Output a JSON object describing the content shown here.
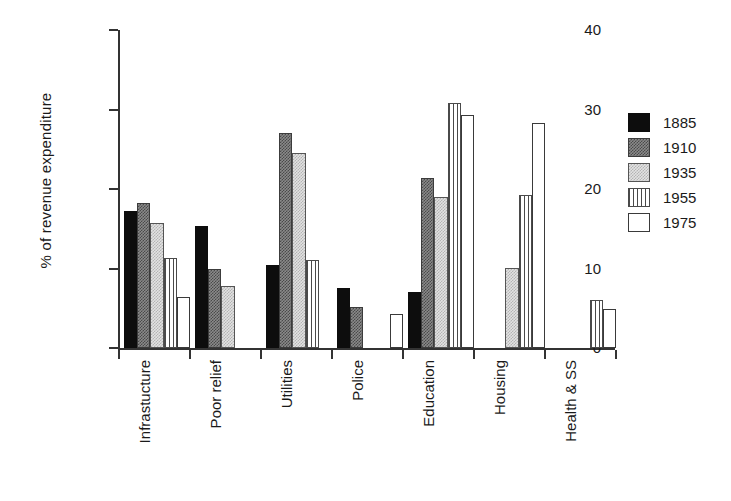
{
  "chart_data": {
    "type": "bar",
    "title": "",
    "subtitle": "",
    "xlabel": "",
    "ylabel": "% of revenue expenditure",
    "ylim": [
      0,
      40
    ],
    "yticks": [
      0,
      10,
      20,
      30,
      40
    ],
    "ytick_labels": [
      "0",
      "10",
      "20",
      "30",
      "40"
    ],
    "grid": false,
    "legend_position": "right",
    "categories": [
      "Infrastucture",
      "Poor relief",
      "Utilities",
      "Police",
      "Education",
      "Housing",
      "Health & SS"
    ],
    "series": [
      {
        "name": "1885",
        "fill": "solid-black",
        "color": "#0d0d0d",
        "values": [
          17.2,
          15.3,
          10.4,
          7.6,
          7.1,
          null,
          null
        ]
      },
      {
        "name": "1910",
        "fill": "dark-gray-dither",
        "color": "#8a8a8a",
        "values": [
          18.3,
          10.0,
          27.0,
          5.2,
          21.4,
          null,
          null
        ]
      },
      {
        "name": "1935",
        "fill": "light-gray-dither",
        "color": "#e2e2e2",
        "values": [
          15.7,
          7.8,
          24.5,
          null,
          19.0,
          10.1,
          null
        ]
      },
      {
        "name": "1955",
        "fill": "vertical-stripes",
        "color": "#ffffff",
        "values": [
          11.3,
          null,
          11.1,
          null,
          30.8,
          19.3,
          6.1
        ]
      },
      {
        "name": "1975",
        "fill": "white-outline",
        "color": "#ffffff",
        "values": [
          6.4,
          null,
          null,
          4.3,
          29.3,
          28.3,
          4.9
        ]
      }
    ]
  },
  "legend": {
    "entries": [
      {
        "label": "1885",
        "fill": "solid-black"
      },
      {
        "label": "1910",
        "fill": "dark-gray-dither"
      },
      {
        "label": "1935",
        "fill": "light-gray-dither"
      },
      {
        "label": "1955",
        "fill": "vertical-stripes"
      },
      {
        "label": "1975",
        "fill": "white-outline"
      }
    ]
  }
}
